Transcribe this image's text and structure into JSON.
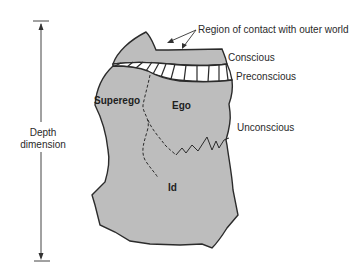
{
  "diagram": {
    "colors": {
      "fill": "#bdbdbd",
      "stroke": "#2b2b2b",
      "text": "#2a2a2a",
      "background": "#ffffff"
    },
    "depth_axis": {
      "line1": "Depth",
      "line2": "dimension"
    },
    "annotations": {
      "contact": "Region of contact with outer world",
      "conscious": "Conscious",
      "preconscious": "Preconscious",
      "unconscious": "Unconscious"
    },
    "regions": {
      "superego": "Superego",
      "ego": "Ego",
      "id": "Id"
    }
  }
}
